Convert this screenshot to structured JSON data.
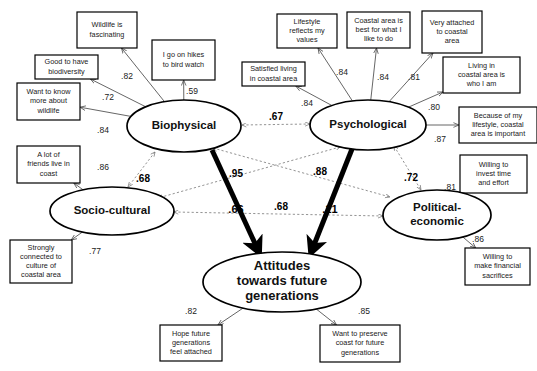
{
  "diagram": {
    "type": "path-diagram"
  },
  "constructs": [
    {
      "id": "biophysical",
      "label": "Biophysical",
      "cx": 184,
      "cy": 126,
      "rx": 57,
      "ry": 26
    },
    {
      "id": "psychological",
      "label": "Psychological",
      "cx": 368,
      "cy": 125,
      "rx": 58,
      "ry": 25
    },
    {
      "id": "socio_cultural",
      "label": "Socio-cultural",
      "cx": 112,
      "cy": 211,
      "rx": 62,
      "ry": 24
    },
    {
      "id": "political_economic",
      "label": "Political-economic",
      "line1": "Political-",
      "line2": "economic",
      "cx": 437,
      "cy": 215,
      "rx": 54,
      "ry": 25
    },
    {
      "id": "attitudes",
      "label": "Attitudes towards future generations",
      "line1": "Attitudes",
      "line2": "towards future",
      "line3": "generations",
      "cx": 282,
      "cy": 282,
      "rx": 79,
      "ry": 30
    }
  ],
  "indicators": [
    {
      "id": "wildlife_fascinating",
      "lines": [
        "Wildlife is",
        "fascinating"
      ],
      "x": 77,
      "y": 12,
      "w": 60,
      "h": 36,
      "construct": "biophysical",
      "loading": ".82",
      "lx": 127,
      "ly": 77
    },
    {
      "id": "good_biodiversity",
      "lines": [
        "Good to have",
        "biodiversity"
      ],
      "x": 35,
      "y": 55,
      "w": 63,
      "h": 24,
      "construct": "biophysical",
      "loading": ".72",
      "lx": 108,
      "ly": 98
    },
    {
      "id": "know_more_wildlife",
      "lines": [
        "Want to know",
        "more about",
        "wildlife"
      ],
      "x": 17,
      "y": 83,
      "w": 63,
      "h": 37,
      "construct": "biophysical",
      "loading": ".84",
      "lx": 103,
      "ly": 131
    },
    {
      "id": "hikes_bird_watch",
      "lines": [
        "I go on hikes",
        "to bird watch"
      ],
      "x": 152,
      "y": 40,
      "w": 63,
      "h": 40,
      "construct": "biophysical",
      "loading": ".59",
      "lx": 192,
      "ly": 92
    },
    {
      "id": "friends_live_coast",
      "lines": [
        "A lot of",
        "friends live in",
        "coast"
      ],
      "x": 17,
      "y": 146,
      "w": 63,
      "h": 37,
      "construct": "socio_cultural",
      "loading": ".86",
      "lx": 103,
      "ly": 168
    },
    {
      "id": "connected_culture",
      "lines": [
        "Strongly",
        "connected to",
        "culture of",
        "coastal area"
      ],
      "x": 10,
      "y": 240,
      "w": 62,
      "h": 43,
      "construct": "socio_cultural",
      "loading": ".77",
      "lx": 95,
      "ly": 252
    },
    {
      "id": "lifestyle_values",
      "lines": [
        "Lifestyle",
        "reflects my",
        "values"
      ],
      "x": 277,
      "y": 14,
      "w": 60,
      "h": 34,
      "construct": "psychological",
      "loading": ".84",
      "lx": 342,
      "ly": 73
    },
    {
      "id": "best_for_what_i_like",
      "lines": [
        "Coastal area is",
        "best for what I",
        "like to do"
      ],
      "x": 347,
      "y": 12,
      "w": 63,
      "h": 36,
      "construct": "psychological",
      "loading": ".84",
      "lx": 383,
      "ly": 78
    },
    {
      "id": "very_attached",
      "lines": [
        "Very attached",
        "to coastal",
        "area"
      ],
      "x": 422,
      "y": 11,
      "w": 60,
      "h": 42,
      "construct": "psychological",
      "loading": ".81",
      "lx": 414,
      "ly": 78
    },
    {
      "id": "satisfied_living",
      "lines": [
        "Satisfied living",
        "in coastal area"
      ],
      "x": 242,
      "y": 62,
      "w": 63,
      "h": 24,
      "construct": "psychological",
      "loading": ".84",
      "lx": 307,
      "ly": 104
    },
    {
      "id": "who_i_am",
      "lines": [
        "Living in",
        "coastal area is",
        "who I am"
      ],
      "x": 443,
      "y": 57,
      "w": 77,
      "h": 36,
      "construct": "psychological",
      "loading": ".80",
      "lx": 434,
      "ly": 108
    },
    {
      "id": "lifestyle_important",
      "lines": [
        "Because of my",
        "lifestyle, coastal",
        "area is  important"
      ],
      "x": 459,
      "y": 107,
      "w": 78,
      "h": 36,
      "construct": "psychological",
      "loading": ".87",
      "lx": 440,
      "ly": 140
    },
    {
      "id": "invest_time_effort",
      "lines": [
        "Willing to",
        "invest time",
        "and effort"
      ],
      "x": 460,
      "y": 155,
      "w": 67,
      "h": 38,
      "construct": "political_economic",
      "loading": ".81",
      "lx": 450,
      "ly": 188
    },
    {
      "id": "financial_sacrifices",
      "lines": [
        "Willing to",
        "make financial",
        "sacrifices"
      ],
      "x": 465,
      "y": 248,
      "w": 65,
      "h": 37,
      "construct": "political_economic",
      "loading": ".86",
      "lx": 478,
      "ly": 240
    },
    {
      "id": "hope_feel_attached",
      "lines": [
        "Hope future",
        "generations",
        "feel attached"
      ],
      "x": 160,
      "y": 325,
      "w": 62,
      "h": 36,
      "construct": "attitudes",
      "loading": ".82",
      "lx": 191,
      "ly": 312
    },
    {
      "id": "preserve_coast",
      "lines": [
        "Want to preserve",
        "coast for future",
        "generations"
      ],
      "x": 320,
      "y": 325,
      "w": 80,
      "h": 37,
      "construct": "attitudes",
      "loading": ".85",
      "lx": 364,
      "ly": 312
    }
  ],
  "structural_paths": [
    {
      "id": "biophysical_to_attitudes",
      "from": "biophysical",
      "to": "attitudes",
      "coefficient": ".66",
      "lx": 236,
      "ly": 210
    },
    {
      "id": "psychological_to_attitudes",
      "from": "psychological",
      "to": "attitudes",
      "coefficient": ".21",
      "lx": 330,
      "ly": 210
    }
  ],
  "correlations": [
    {
      "id": "bio_psy",
      "from": "biophysical",
      "to": "psychological",
      "coefficient": ".67",
      "x1": 242,
      "y1": 125,
      "x2": 310,
      "y2": 124,
      "lx": 276,
      "ly": 117
    },
    {
      "id": "bio_soc",
      "from": "biophysical",
      "to": "socio_cultural",
      "coefficient": ".68",
      "x1": 155,
      "y1": 152,
      "x2": 128,
      "y2": 187,
      "lx": 143,
      "ly": 179
    },
    {
      "id": "bio_pol",
      "from": "biophysical",
      "to": "political_economic",
      "coefficient": ".95",
      "x1": 213,
      "y1": 148,
      "x2": 390,
      "y2": 197,
      "lx": 236,
      "ly": 174
    },
    {
      "id": "psy_soc",
      "from": "psychological",
      "to": "socio_cultural",
      "coefficient": ".88",
      "x1": 340,
      "y1": 147,
      "x2": 158,
      "y2": 198,
      "lx": 320,
      "ly": 172
    },
    {
      "id": "psy_pol",
      "from": "psychological",
      "to": "political_economic",
      "coefficient": ".72",
      "x1": 394,
      "y1": 146,
      "x2": 421,
      "y2": 190,
      "lx": 411,
      "ly": 178
    },
    {
      "id": "soc_pol",
      "from": "socio_cultural",
      "to": "political_economic",
      "coefficient": ".68",
      "x1": 174,
      "y1": 212,
      "x2": 383,
      "y2": 216,
      "lx": 281,
      "ly": 207
    }
  ],
  "icons": {
    "arrow_head": "arrowhead-icon",
    "double_arrow": "double-arrowhead-icon"
  },
  "colors": {
    "background": "#ffffff",
    "stroke": "#000000",
    "measurement_line": "#555555",
    "correlation_line": "#777777"
  }
}
